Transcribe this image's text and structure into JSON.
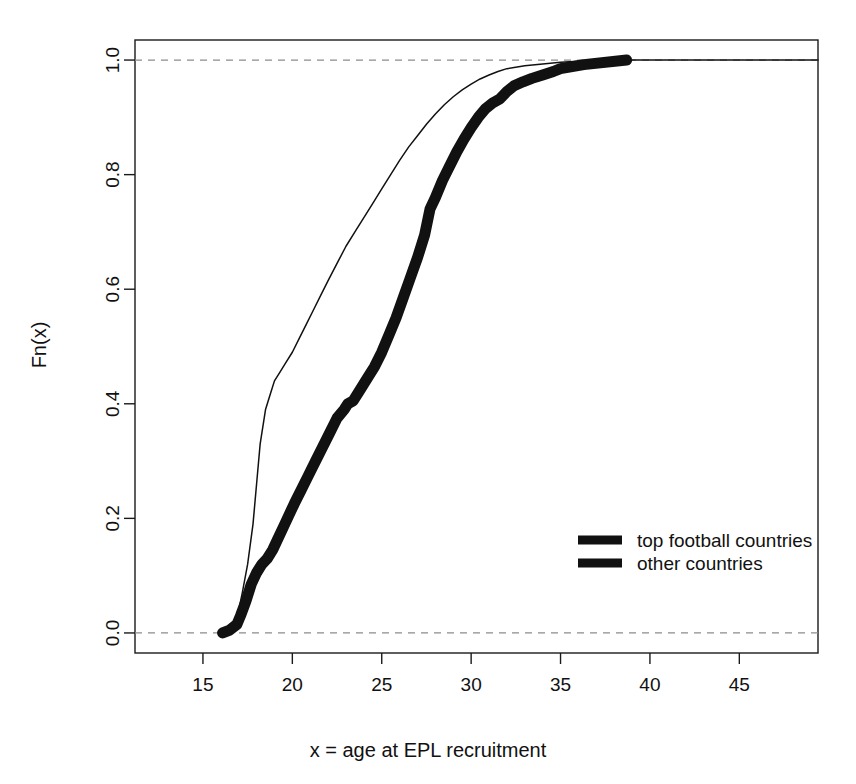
{
  "chart_data": {
    "type": "line",
    "title": "",
    "subtitle": "",
    "xlabel": "x = age at EPL recruitment",
    "ylabel": "Fn(x)",
    "xlim": [
      11.2,
      49.4
    ],
    "ylim": [
      -0.035,
      1.035
    ],
    "grid": false,
    "xticks": [
      15,
      20,
      25,
      30,
      35,
      40,
      45
    ],
    "xtick_labels": [
      "15",
      "20",
      "25",
      "30",
      "35",
      "40",
      "45"
    ],
    "yticks": [
      0.0,
      0.2,
      0.4,
      0.6,
      0.8,
      1.0
    ],
    "ytick_labels": [
      "0.0",
      "0.2",
      "0.4",
      "0.6",
      "0.8",
      "1.0"
    ],
    "reference_lines": [
      {
        "name": "y-zero-dashed",
        "y": 0.0,
        "style": "dashed",
        "color": "#8c8c8c"
      },
      {
        "name": "y-one-dashed",
        "y": 1.0,
        "style": "dashed",
        "color": "#8c8c8c"
      }
    ],
    "legend_position": "bottom-right",
    "series": [
      {
        "name": "top football countries",
        "style": "thin-line",
        "linewidth": 1.5,
        "color": "#111111",
        "x": [
          16.0,
          16.4,
          16.8,
          17.0,
          17.2,
          17.5,
          17.8,
          18.0,
          18.2,
          18.5,
          18.8,
          19.0,
          19.3,
          19.6,
          20.0,
          20.4,
          20.8,
          21.2,
          21.6,
          22.0,
          22.5,
          23.0,
          23.5,
          24.0,
          24.5,
          25.0,
          25.5,
          26.0,
          26.5,
          27.0,
          27.5,
          28.0,
          28.5,
          29.0,
          29.5,
          30.0,
          30.5,
          31.0,
          31.5,
          32.0,
          33.0,
          34.0,
          35.0,
          36.0,
          37.0,
          38.7,
          49.4
        ],
        "y": [
          0.0,
          0.005,
          0.02,
          0.04,
          0.07,
          0.12,
          0.19,
          0.26,
          0.33,
          0.39,
          0.42,
          0.44,
          0.455,
          0.47,
          0.49,
          0.515,
          0.54,
          0.565,
          0.59,
          0.615,
          0.645,
          0.675,
          0.7,
          0.725,
          0.75,
          0.775,
          0.8,
          0.825,
          0.848,
          0.868,
          0.888,
          0.906,
          0.922,
          0.936,
          0.948,
          0.958,
          0.967,
          0.974,
          0.98,
          0.985,
          0.99,
          0.993,
          0.996,
          0.998,
          0.999,
          1.0,
          1.0
        ]
      },
      {
        "name": "other countries",
        "style": "thick-line",
        "linewidth": 11,
        "color": "#111111",
        "x": [
          16.1,
          16.5,
          16.9,
          17.1,
          17.4,
          17.7,
          18.0,
          18.3,
          18.6,
          18.9,
          19.2,
          19.5,
          19.8,
          20.1,
          20.5,
          20.9,
          21.3,
          21.7,
          22.1,
          22.5,
          22.9,
          23.1,
          23.4,
          23.8,
          24.2,
          24.6,
          25.0,
          25.4,
          25.8,
          26.2,
          26.6,
          27.0,
          27.4,
          27.7,
          28.0,
          28.4,
          28.8,
          29.2,
          29.6,
          30.0,
          30.4,
          30.8,
          31.2,
          31.6,
          32.0,
          32.4,
          32.9,
          33.4,
          34.0,
          34.6,
          35.0,
          36.3,
          38.7
        ],
        "y": [
          0.0,
          0.005,
          0.015,
          0.03,
          0.055,
          0.085,
          0.105,
          0.12,
          0.13,
          0.145,
          0.165,
          0.185,
          0.205,
          0.225,
          0.25,
          0.275,
          0.3,
          0.325,
          0.35,
          0.375,
          0.39,
          0.4,
          0.405,
          0.425,
          0.445,
          0.465,
          0.49,
          0.52,
          0.55,
          0.585,
          0.62,
          0.655,
          0.695,
          0.74,
          0.76,
          0.79,
          0.815,
          0.84,
          0.862,
          0.882,
          0.9,
          0.915,
          0.925,
          0.932,
          0.945,
          0.955,
          0.962,
          0.968,
          0.974,
          0.98,
          0.985,
          0.992,
          1.0
        ]
      }
    ],
    "legend": [
      {
        "label": "top football countries",
        "marker": "thick-line"
      },
      {
        "label": "other countries",
        "marker": "thick-line"
      }
    ]
  }
}
